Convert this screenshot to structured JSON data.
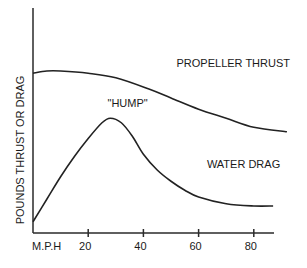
{
  "chart_data": {
    "type": "line",
    "title": "",
    "xlabel": "M.P.H",
    "ylabel": "POUNDS THRUST OR DRAG",
    "xlim": [
      0,
      95
    ],
    "ylim": [
      0,
      100
    ],
    "y_units_note": "relative (no y tick values shown)",
    "x_ticks": [
      20,
      40,
      60,
      80
    ],
    "x_tick_labels": [
      "20",
      "40",
      "60",
      "80"
    ],
    "grid": false,
    "series": [
      {
        "name": "PROPELLER THRUST",
        "x": [
          0,
          5,
          10,
          20,
          30,
          42,
          50,
          60,
          70,
          80,
          92
        ],
        "y": [
          71,
          72,
          72,
          71,
          69,
          64,
          60,
          55,
          51,
          47,
          45
        ]
      },
      {
        "name": "WATER DRAG",
        "x": [
          0,
          5,
          10,
          15,
          20,
          25,
          28,
          32,
          36,
          40,
          45,
          50,
          55,
          60,
          70,
          80,
          87
        ],
        "y": [
          5,
          15,
          25,
          34,
          42,
          49,
          51,
          49,
          43,
          35,
          28,
          23,
          19,
          16,
          13,
          12,
          12
        ]
      }
    ],
    "annotations": [
      {
        "text": "PROPELLER THRUST",
        "x": 52,
        "y": 74
      },
      {
        "text": "\"HUMP\"",
        "x": 27,
        "y": 56
      },
      {
        "text": "WATER DRAG",
        "x": 63,
        "y": 29
      }
    ]
  }
}
